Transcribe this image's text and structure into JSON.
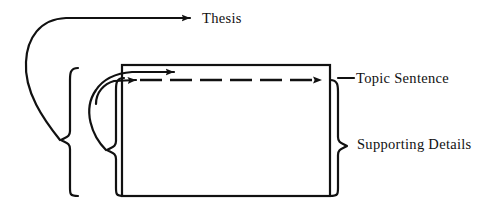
{
  "figure": {
    "title": "",
    "background_color": "#ffffff",
    "ink_color": "#111111",
    "width": 484,
    "height": 213
  },
  "labels": {
    "thesis": "Thesis",
    "topic_sentence": "Topic Sentence",
    "supporting_details": "Supporting Details"
  },
  "icons": {
    "thesis_arrow": "arrow-right-icon",
    "topic_sentence_arrow": "arrow-left-icon",
    "inner_solid_arrow": "arrow-right-icon",
    "inner_dashed_arrow": "arrow-right-icon",
    "left_outer_brace": "curly-brace-left-icon",
    "left_inner_brace": "curly-brace-left-icon",
    "right_brace": "curly-brace-right-icon",
    "paragraph_box": "rectangle-outline-icon",
    "dashed_divider": "dashed-line-icon"
  },
  "shapes": {
    "paragraph_box": {
      "x": 122,
      "y": 65,
      "width": 208,
      "height": 131,
      "stroke_width": 2.2,
      "fill": "none"
    },
    "dashed_divider": {
      "x1": 140,
      "x2": 322,
      "y": 80,
      "dash": "22 8",
      "stroke_width": 2.6
    },
    "left_outer_brace": {
      "top_y": 68,
      "bottom_y": 196,
      "spine_x": 70,
      "tip_x": 60,
      "notch_y": 140
    },
    "left_inner_brace": {
      "top_y": 78,
      "bottom_y": 196,
      "spine_x": 116,
      "tip_x": 106,
      "notch_y": 150
    },
    "right_brace": {
      "top_y": 80,
      "bottom_y": 196,
      "spine_x": 338,
      "tip_x": 348,
      "notch_y": 146
    },
    "thesis_connector": {
      "start_x": 62,
      "start_y": 140,
      "corner_x": 40,
      "corner_y": 30,
      "end_x": 196,
      "end_y": 18
    },
    "topic_connector": {
      "start_x": 108,
      "start_y": 150,
      "end_x": 322,
      "end_y": 72
    }
  },
  "relationships": [
    {
      "from": "left-outer-brace",
      "to": "thesis",
      "type": "arrow"
    },
    {
      "from": "left-inner-brace",
      "to": "topic-sentence-line",
      "type": "arrow"
    },
    {
      "from": "paragraph-box",
      "to": "topic-sentence",
      "type": "arrow"
    },
    {
      "from": "right-brace",
      "to": "supporting-details",
      "type": "bracket"
    }
  ]
}
